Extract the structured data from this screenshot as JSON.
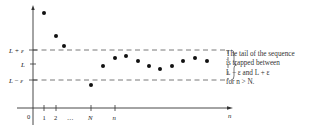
{
  "diagram": {
    "axes": {
      "origin_label": "0",
      "x_axis_label": "n",
      "x_ticks": [
        "1",
        "2",
        "…",
        "N",
        "n"
      ],
      "y_ticks": [
        "L + ε",
        "L",
        "L − ε"
      ]
    },
    "band": {
      "upper_label": "L + ε",
      "center_label": "L",
      "lower_label": "L − ε",
      "line_style": "dashed"
    },
    "points": [
      {
        "x": 44,
        "y": 13
      },
      {
        "x": 56,
        "y": 36
      },
      {
        "x": 64,
        "y": 46
      },
      {
        "x": 91,
        "y": 85
      },
      {
        "x": 103,
        "y": 66
      },
      {
        "x": 115,
        "y": 58
      },
      {
        "x": 126,
        "y": 56
      },
      {
        "x": 138,
        "y": 61
      },
      {
        "x": 149,
        "y": 66
      },
      {
        "x": 160,
        "y": 69
      },
      {
        "x": 172,
        "y": 66
      },
      {
        "x": 183,
        "y": 61
      },
      {
        "x": 195,
        "y": 58
      },
      {
        "x": 207,
        "y": 61
      }
    ],
    "annotation": {
      "line1": "The tail of the sequence",
      "line2": "is trapped between",
      "line3": "L − ε and L + ε",
      "line4": "for n > N."
    },
    "colors": {
      "ink": "#222222",
      "dash": "#555555",
      "background": "#ffffff"
    }
  }
}
